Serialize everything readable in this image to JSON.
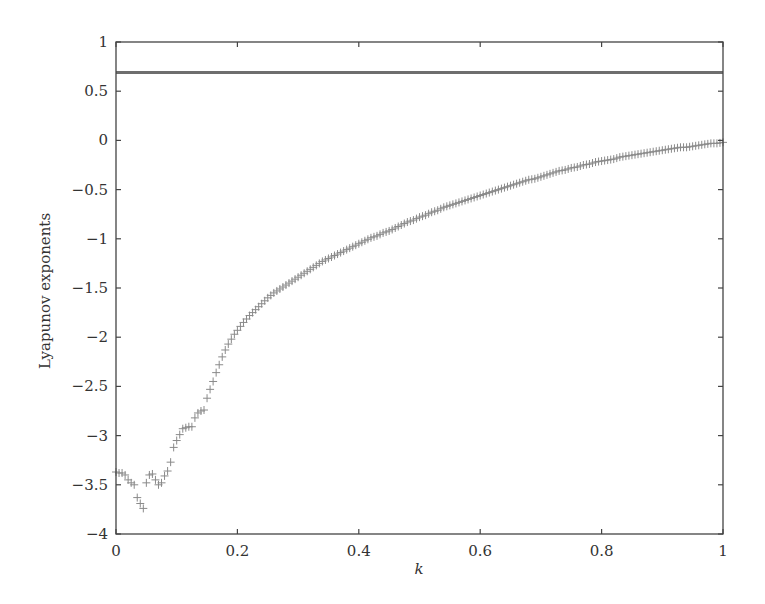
{
  "chart_data": {
    "type": "scatter",
    "title": "",
    "xlabel": "k",
    "ylabel": "Lyapunov exponents",
    "xlim": [
      0,
      1
    ],
    "ylim": [
      -4,
      1
    ],
    "grid": false,
    "legend": null,
    "xticks": [
      0,
      0.2,
      0.4,
      0.6,
      0.8,
      1
    ],
    "xtick_labels": [
      "0",
      "0.2",
      "0.4",
      "0.6",
      "0.8",
      "1"
    ],
    "yticks": [
      -4,
      -3.5,
      -3,
      -2.5,
      -2,
      -1.5,
      -1,
      -0.5,
      0,
      0.5,
      1
    ],
    "ytick_labels": [
      "−4",
      "−3.5",
      "−3",
      "−2.5",
      "−2",
      "−1.5",
      "−1",
      "−0.5",
      "0",
      "0.5",
      "1"
    ],
    "series": [
      {
        "name": "largest Lyapunov exponent",
        "marker": "line",
        "color": "#6e6e6e",
        "x": [
          0,
          1
        ],
        "values": [
          0.69,
          0.69
        ]
      },
      {
        "name": "second Lyapunov exponent",
        "marker": "+",
        "color": "#8a8a8a",
        "x": [
          0,
          0.005,
          0.01,
          0.015,
          0.02,
          0.025,
          0.03,
          0.035,
          0.04,
          0.045,
          0.05,
          0.055,
          0.06,
          0.065,
          0.07,
          0.075,
          0.08,
          0.085,
          0.09,
          0.095,
          0.1,
          0.105,
          0.11,
          0.115,
          0.12,
          0.125,
          0.13,
          0.135,
          0.14,
          0.145,
          0.15,
          0.155,
          0.16,
          0.165,
          0.17,
          0.175,
          0.18,
          0.185,
          0.19,
          0.195,
          0.2,
          0.21,
          0.22,
          0.23,
          0.24,
          0.25,
          0.26,
          0.27,
          0.28,
          0.29,
          0.3,
          0.31,
          0.32,
          0.33,
          0.34,
          0.35,
          0.36,
          0.37,
          0.38,
          0.39,
          0.4,
          0.41,
          0.42,
          0.43,
          0.44,
          0.45,
          0.46,
          0.47,
          0.48,
          0.49,
          0.5,
          0.51,
          0.52,
          0.53,
          0.54,
          0.55,
          0.56,
          0.57,
          0.58,
          0.59,
          0.6,
          0.61,
          0.62,
          0.63,
          0.64,
          0.65,
          0.66,
          0.67,
          0.68,
          0.69,
          0.7,
          0.71,
          0.72,
          0.73,
          0.74,
          0.75,
          0.76,
          0.77,
          0.78,
          0.79,
          0.8,
          0.81,
          0.82,
          0.83,
          0.84,
          0.85,
          0.86,
          0.87,
          0.88,
          0.89,
          0.9,
          0.91,
          0.92,
          0.93,
          0.94,
          0.95,
          0.96,
          0.97,
          0.98,
          0.99,
          1.0
        ],
        "values": [
          -3.37,
          -3.38,
          -3.38,
          -3.4,
          -3.45,
          -3.48,
          -3.5,
          -3.63,
          -3.69,
          -3.74,
          -3.48,
          -3.4,
          -3.39,
          -3.45,
          -3.5,
          -3.48,
          -3.41,
          -3.36,
          -3.27,
          -3.12,
          -3.05,
          -2.99,
          -2.93,
          -2.92,
          -2.91,
          -2.91,
          -2.82,
          -2.77,
          -2.75,
          -2.74,
          -2.62,
          -2.53,
          -2.45,
          -2.36,
          -2.28,
          -2.2,
          -2.13,
          -2.07,
          -2.02,
          -1.97,
          -1.93,
          -1.85,
          -1.78,
          -1.72,
          -1.66,
          -1.6,
          -1.55,
          -1.51,
          -1.47,
          -1.43,
          -1.39,
          -1.35,
          -1.31,
          -1.27,
          -1.23,
          -1.2,
          -1.17,
          -1.14,
          -1.11,
          -1.08,
          -1.05,
          -1.02,
          -0.99,
          -0.97,
          -0.94,
          -0.92,
          -0.89,
          -0.86,
          -0.83,
          -0.81,
          -0.78,
          -0.76,
          -0.73,
          -0.71,
          -0.68,
          -0.66,
          -0.64,
          -0.62,
          -0.6,
          -0.58,
          -0.56,
          -0.54,
          -0.52,
          -0.5,
          -0.48,
          -0.46,
          -0.44,
          -0.42,
          -0.4,
          -0.39,
          -0.37,
          -0.35,
          -0.33,
          -0.31,
          -0.3,
          -0.28,
          -0.27,
          -0.25,
          -0.24,
          -0.22,
          -0.21,
          -0.2,
          -0.19,
          -0.17,
          -0.16,
          -0.15,
          -0.14,
          -0.13,
          -0.12,
          -0.11,
          -0.1,
          -0.09,
          -0.08,
          -0.07,
          -0.07,
          -0.06,
          -0.05,
          -0.04,
          -0.03,
          -0.03,
          -0.02
        ]
      }
    ]
  },
  "layout": {
    "plot": {
      "left": 116,
      "top": 42,
      "right": 723,
      "bottom": 534
    }
  }
}
